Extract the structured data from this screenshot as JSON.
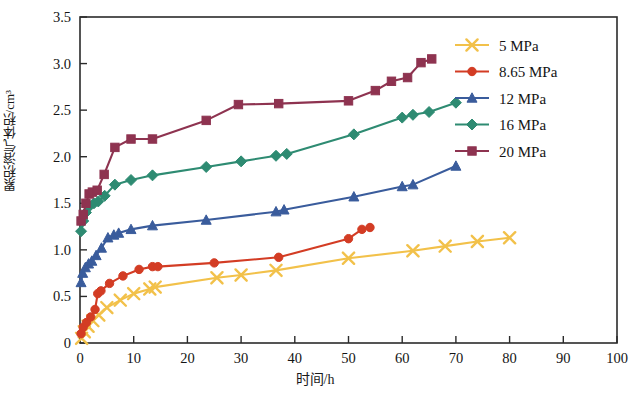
{
  "chart_data": {
    "type": "line",
    "title": "",
    "xlabel": "时间/h",
    "ylabel": "累积溶气体积/cm³",
    "xlim": [
      0,
      100
    ],
    "ylim": [
      0,
      3.5
    ],
    "xticks": [
      0,
      10,
      20,
      30,
      40,
      50,
      60,
      70,
      80,
      90,
      100
    ],
    "yticks": [
      "0",
      "0.5",
      "1.0",
      "1.5",
      "2.0",
      "2.5",
      "3.0",
      "3.5"
    ],
    "ytick_values": [
      0,
      0.5,
      1.0,
      1.5,
      2.0,
      2.5,
      3.0,
      3.5
    ],
    "grid": false,
    "legend_position": "upper right",
    "series": [
      {
        "name": "5 MPa",
        "color": "#F2C14A",
        "marker": "x",
        "x": [
          0.3,
          0.8,
          1.5,
          2.4,
          3.5,
          5.0,
          7.5,
          10.0,
          13.0,
          14.0,
          25.5,
          30.0,
          36.5,
          50.0,
          62.0,
          68.0,
          74.0,
          80.0
        ],
        "y": [
          0.05,
          0.12,
          0.18,
          0.24,
          0.3,
          0.38,
          0.46,
          0.53,
          0.58,
          0.6,
          0.7,
          0.73,
          0.78,
          0.91,
          0.99,
          1.04,
          1.09,
          1.13
        ]
      },
      {
        "name": "8.65 MPa",
        "color": "#D33C24",
        "marker": "o",
        "x": [
          0.2,
          0.6,
          1.2,
          2.0,
          2.8,
          3.3,
          3.9,
          5.5,
          8.0,
          11.0,
          13.5,
          14.5,
          25.0,
          37.0,
          50.0,
          52.5,
          54.0
        ],
        "y": [
          0.1,
          0.17,
          0.22,
          0.28,
          0.36,
          0.53,
          0.56,
          0.64,
          0.72,
          0.79,
          0.82,
          0.82,
          0.86,
          0.92,
          1.12,
          1.22,
          1.24
        ]
      },
      {
        "name": "12 MPa",
        "color": "#3A5C9C",
        "marker": "^",
        "x": [
          0.2,
          0.5,
          1.0,
          1.6,
          2.2,
          3.0,
          4.0,
          5.2,
          6.3,
          7.2,
          9.5,
          13.5,
          23.5,
          36.5,
          38.0,
          51.0,
          60.0,
          62.0,
          70.0
        ],
        "y": [
          0.65,
          0.75,
          0.81,
          0.85,
          0.88,
          0.94,
          1.02,
          1.13,
          1.16,
          1.18,
          1.22,
          1.26,
          1.32,
          1.41,
          1.43,
          1.57,
          1.68,
          1.7,
          1.9
        ]
      },
      {
        "name": "16 MPa",
        "color": "#2E8B72",
        "marker": "D",
        "x": [
          0.2,
          0.6,
          1.1,
          1.8,
          2.6,
          3.4,
          4.6,
          6.5,
          9.5,
          13.5,
          23.5,
          30.0,
          36.5,
          38.5,
          51.0,
          60.0,
          62.0,
          65.0,
          70.0
        ],
        "y": [
          1.2,
          1.31,
          1.4,
          1.47,
          1.5,
          1.52,
          1.58,
          1.7,
          1.75,
          1.8,
          1.89,
          1.95,
          2.01,
          2.03,
          2.24,
          2.42,
          2.45,
          2.48,
          2.58
        ]
      },
      {
        "name": "20 MPa",
        "color": "#8E3350",
        "marker": "s",
        "x": [
          0.2,
          0.6,
          1.1,
          1.7,
          2.3,
          3.2,
          4.5,
          6.5,
          9.5,
          13.5,
          23.5,
          29.5,
          37.0,
          50.0,
          55.0,
          58.0,
          61.0,
          63.5,
          65.5
        ],
        "y": [
          1.31,
          1.38,
          1.5,
          1.6,
          1.62,
          1.64,
          1.81,
          2.1,
          2.19,
          2.19,
          2.39,
          2.56,
          2.57,
          2.6,
          2.71,
          2.81,
          2.85,
          3.01,
          3.05
        ]
      }
    ]
  },
  "legend": {
    "items": [
      {
        "label": "5 MPa",
        "color": "#F2C14A",
        "marker": "x"
      },
      {
        "label": "8.65 MPa",
        "color": "#D33C24",
        "marker": "o"
      },
      {
        "label": "12 MPa",
        "color": "#3A5C9C",
        "marker": "^"
      },
      {
        "label": "16 MPa",
        "color": "#2E8B72",
        "marker": "D"
      },
      {
        "label": "20 MPa",
        "color": "#8E3350",
        "marker": "s"
      }
    ]
  },
  "axes": {
    "y_label": "累积溶气体积/cm³",
    "x_label": "时间/h"
  }
}
